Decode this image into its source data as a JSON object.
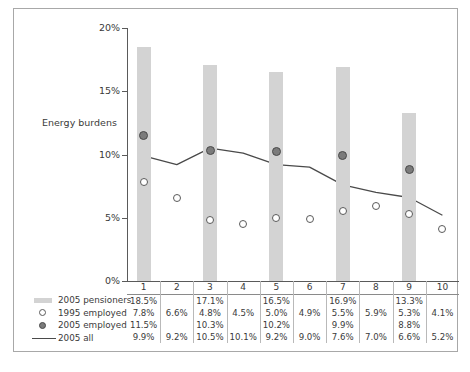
{
  "chart_data": {
    "type": "bar",
    "title": "",
    "ylabel": "Energy burdens",
    "xlabel": "",
    "ylim": [
      0,
      20
    ],
    "ytick_labels": [
      "0%",
      "5%",
      "10%",
      "15%",
      "20%"
    ],
    "ytick_values": [
      0,
      5,
      10,
      15,
      20
    ],
    "grid": false,
    "legend_position": "bottom-left",
    "categories": [
      "1",
      "2",
      "3",
      "4",
      "5",
      "6",
      "7",
      "8",
      "9",
      "10"
    ],
    "series": [
      {
        "name": "2005 pensioners",
        "kind": "bar",
        "color": "#d3d3d3",
        "values": [
          18.5,
          null,
          17.1,
          null,
          16.5,
          null,
          16.9,
          null,
          13.3,
          null
        ],
        "labels": [
          "18.5%",
          "",
          "17.1%",
          "",
          "16.5%",
          "",
          "16.9%",
          "",
          "13.3%",
          ""
        ]
      },
      {
        "name": "1995 employed",
        "kind": "scatter-open",
        "color": "#ffffff",
        "values": [
          7.8,
          6.6,
          4.8,
          4.5,
          5.0,
          4.9,
          5.5,
          5.9,
          5.3,
          4.1
        ],
        "labels": [
          "7.8%",
          "6.6%",
          "4.8%",
          "4.5%",
          "5.0%",
          "4.9%",
          "5.5%",
          "5.9%",
          "5.3%",
          "4.1%"
        ]
      },
      {
        "name": "2005 employed",
        "kind": "scatter-filled",
        "color": "#7b7b7b",
        "values": [
          11.5,
          null,
          10.3,
          null,
          10.2,
          null,
          9.9,
          null,
          8.8,
          null
        ],
        "labels": [
          "11.5%",
          "",
          "10.3%",
          "",
          "10.2%",
          "",
          "9.9%",
          "",
          "8.8%",
          ""
        ]
      },
      {
        "name": "2005 all",
        "kind": "line",
        "color": "#4a4a4a",
        "values": [
          9.9,
          9.2,
          10.5,
          10.1,
          9.2,
          9.0,
          7.6,
          7.0,
          6.6,
          5.2
        ],
        "labels": [
          "9.9%",
          "9.2%",
          "10.5%",
          "10.1%",
          "9.2%",
          "9.0%",
          "7.6%",
          "7.0%",
          "6.6%",
          "5.2%"
        ]
      }
    ]
  },
  "axis": {
    "y_title": "Energy burdens",
    "y_ticks": [
      "20%",
      "15%",
      "10%",
      "5%",
      "0%"
    ]
  },
  "legend": {
    "items": [
      {
        "label": "2005 pensioners",
        "marker": "bar-swatch"
      },
      {
        "label": "1995 employed",
        "marker": "open-circle"
      },
      {
        "label": "2005 employed",
        "marker": "filled-circle"
      },
      {
        "label": "2005 all",
        "marker": "line-segment"
      }
    ]
  },
  "table": {
    "header": [
      "1",
      "2",
      "3",
      "4",
      "5",
      "6",
      "7",
      "8",
      "9",
      "10"
    ],
    "rows": [
      [
        "18.5%",
        "",
        "17.1%",
        "",
        "16.5%",
        "",
        "16.9%",
        "",
        "13.3%",
        ""
      ],
      [
        "7.8%",
        "6.6%",
        "4.8%",
        "4.5%",
        "5.0%",
        "4.9%",
        "5.5%",
        "5.9%",
        "5.3%",
        "4.1%"
      ],
      [
        "11.5%",
        "",
        "10.3%",
        "",
        "10.2%",
        "",
        "9.9%",
        "",
        "8.8%",
        ""
      ],
      [
        "9.9%",
        "9.2%",
        "10.5%",
        "10.1%",
        "9.2%",
        "9.0%",
        "7.6%",
        "7.0%",
        "6.6%",
        "5.2%"
      ]
    ]
  },
  "caption": {
    "text": ""
  }
}
